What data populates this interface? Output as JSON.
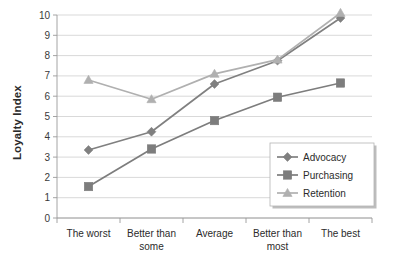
{
  "chart_data": {
    "type": "line",
    "title": "",
    "xlabel": "",
    "ylabel": "Loyalty Index",
    "categories": [
      "The worst",
      "Better than some",
      "Average",
      "Better than most",
      "The best"
    ],
    "category_lines": [
      [
        "The worst"
      ],
      [
        "Better than",
        "some"
      ],
      [
        "Average"
      ],
      [
        "Better than",
        "most"
      ],
      [
        "The best"
      ]
    ],
    "ylim": [
      0,
      10
    ],
    "ytick_labels": [
      "0",
      "1",
      "2",
      "3",
      "4",
      "5",
      "6",
      "7",
      "8",
      "9",
      "10"
    ],
    "ytick_values": [
      0,
      1,
      2,
      3,
      4,
      5,
      6,
      7,
      8,
      9,
      10
    ],
    "grid": true,
    "legend_position": "lower-right",
    "series": [
      {
        "name": "Advocacy",
        "marker": "diamond",
        "color": "#808080",
        "values": [
          3.35,
          4.25,
          6.6,
          7.75,
          9.85
        ]
      },
      {
        "name": "Purchasing",
        "marker": "square",
        "color": "#7d7d7d",
        "values": [
          1.55,
          3.4,
          4.8,
          5.95,
          6.65
        ]
      },
      {
        "name": "Retention",
        "marker": "triangle",
        "color": "#b0b0b0",
        "values": [
          6.8,
          5.85,
          7.1,
          7.8,
          10.1
        ]
      }
    ]
  },
  "colors": {
    "background": "#ffffff",
    "gridline": "#c9c9c9",
    "axis": "#9a9a9a",
    "text": "#2b2b2b"
  }
}
